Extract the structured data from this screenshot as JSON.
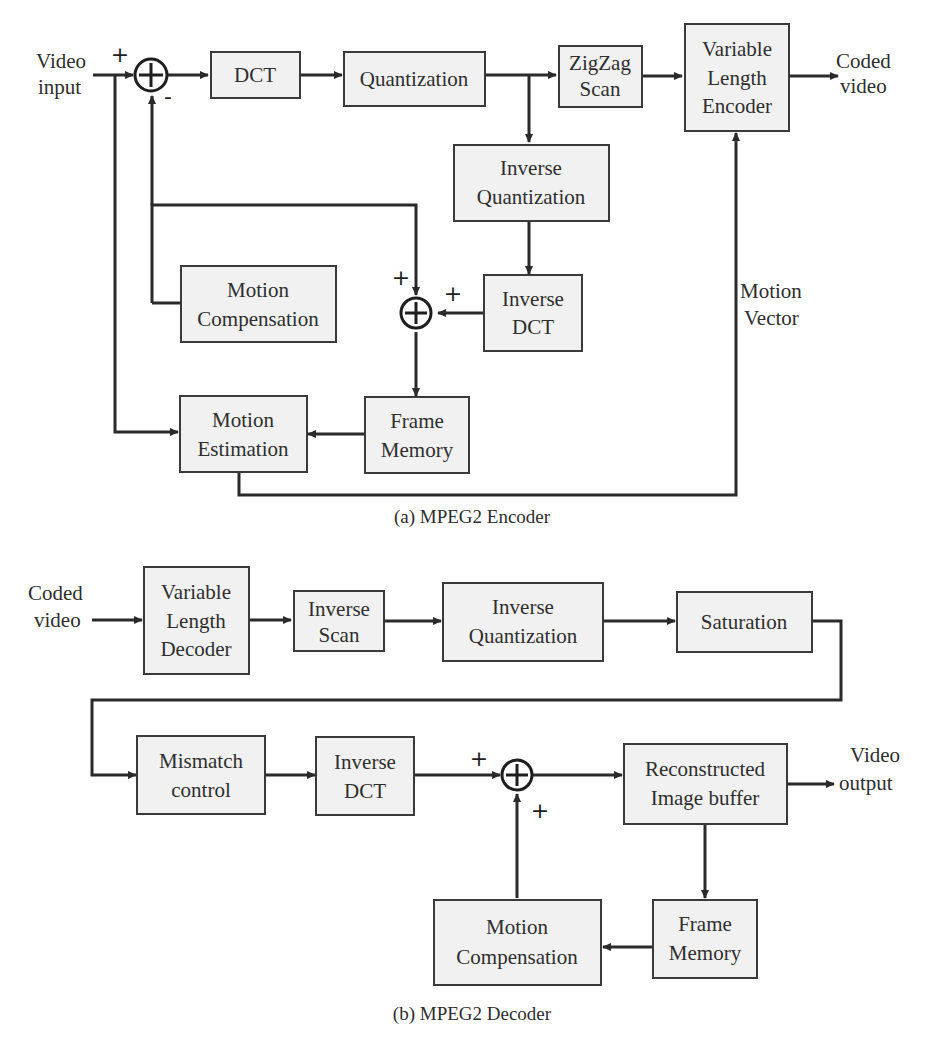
{
  "encoder": {
    "caption": "(a) MPEG2 Encoder",
    "input_label": [
      "Video",
      "input"
    ],
    "output_label": [
      "Coded",
      "video"
    ],
    "motion_vector_label": [
      "Motion",
      "Vector"
    ],
    "signs": {
      "input_plus": "+",
      "feedback_minus": "-",
      "recon_plus_top": "+",
      "recon_plus_right": "+"
    },
    "blocks": {
      "dct": [
        "DCT"
      ],
      "quantization": [
        "Quantization"
      ],
      "zigzag": [
        "ZigZag",
        "Scan"
      ],
      "vle": [
        "Variable",
        "Length",
        "Encoder"
      ],
      "inv_quant": [
        "Inverse",
        "Quantization"
      ],
      "inv_dct": [
        "Inverse",
        "DCT"
      ],
      "motion_comp": [
        "Motion",
        "Compensation"
      ],
      "motion_est": [
        "Motion",
        "Estimation"
      ],
      "frame_mem": [
        "Frame",
        "Memory"
      ]
    }
  },
  "decoder": {
    "caption": "(b) MPEG2 Decoder",
    "input_label": [
      "Coded",
      "video"
    ],
    "output_label": [
      "Video",
      "output"
    ],
    "signs": {
      "top_plus": "+",
      "bottom_plus": "+"
    },
    "blocks": {
      "vld": [
        "Variable",
        "Length",
        "Decoder"
      ],
      "inv_scan": [
        "Inverse",
        "Scan"
      ],
      "inv_quant": [
        "Inverse",
        "Quantization"
      ],
      "saturation": [
        "Saturation"
      ],
      "mismatch": [
        "Mismatch",
        "control"
      ],
      "inv_dct": [
        "Inverse",
        "DCT"
      ],
      "recon_buffer": [
        "Reconstructed",
        "Image buffer"
      ],
      "frame_mem": [
        "Frame",
        "Memory"
      ],
      "motion_comp": [
        "Motion",
        "Compensation"
      ]
    }
  },
  "colors": {
    "block_fill": "#f1f1f1",
    "line": "#2a2a2a",
    "background": "#ffffff"
  }
}
